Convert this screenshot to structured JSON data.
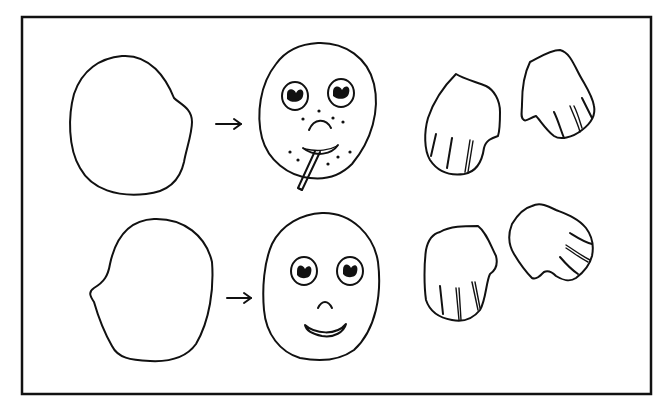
{
  "figure": {
    "background": "#ffffff",
    "ink_color": "#111111",
    "frame": {
      "x": 21,
      "y": 16,
      "width": 631,
      "height": 379
    },
    "rows": [
      {
        "id": "top-row",
        "items": [
          {
            "kind": "head-outline",
            "description": "blank head outline, profile bump on right"
          },
          {
            "kind": "arrow",
            "direction": "right"
          },
          {
            "kind": "face",
            "description": "sad face with freckles, frown and cigarette"
          },
          {
            "kind": "hand",
            "description": "hand with three finger lines, pointing down-left"
          },
          {
            "kind": "hand",
            "description": "hand with three finger lines, pointing down-right"
          }
        ]
      },
      {
        "id": "bottom-row",
        "items": [
          {
            "kind": "head-outline",
            "description": "blank head outline, profile bump on left"
          },
          {
            "kind": "arrow",
            "direction": "right"
          },
          {
            "kind": "face",
            "description": "smiling face with round eyes and small nose"
          },
          {
            "kind": "hand",
            "description": "hand with three finger lines, pointing down"
          },
          {
            "kind": "hand",
            "description": "hand with three finger lines, pointing right"
          }
        ]
      }
    ]
  }
}
